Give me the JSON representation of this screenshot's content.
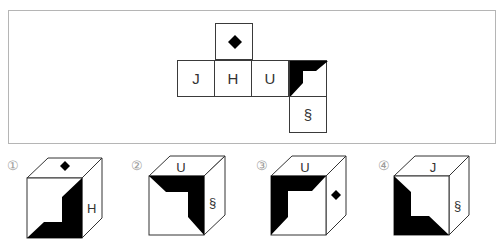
{
  "net": {
    "faces": [
      {
        "id": "top",
        "content": "diamond-icon",
        "label": ""
      },
      {
        "id": "left",
        "label": "J"
      },
      {
        "id": "center",
        "label": "H"
      },
      {
        "id": "right",
        "label": "U"
      },
      {
        "id": "far-right",
        "content": "black-corner-pattern",
        "label": ""
      },
      {
        "id": "bottom",
        "label": "§"
      }
    ]
  },
  "options": [
    {
      "number": "①",
      "top": "◆",
      "front": "black-L-pattern",
      "side": "H"
    },
    {
      "number": "②",
      "top": "U",
      "front": "black-L-pattern",
      "side": "§"
    },
    {
      "number": "③",
      "top": "U",
      "front": "black-L-pattern",
      "side": "◆"
    },
    {
      "number": "④",
      "top": "J",
      "front": "black-L-pattern",
      "side": "§"
    }
  ],
  "colors": {
    "line": "#333333",
    "fill": "#000000",
    "frame": "#b5b5b5",
    "number": "#9a9a9a"
  }
}
